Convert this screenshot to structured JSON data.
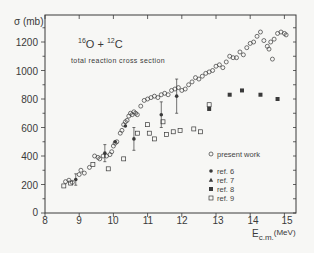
{
  "chart_data": {
    "type": "scatter",
    "title": "16O + 12C",
    "title_parts": {
      "a_mass": "16",
      "a_el": "O",
      "plus": "+",
      "b_mass": "12",
      "b_el": "C"
    },
    "subtitle": "total reaction cross section",
    "xlabel": "E",
    "xlabel_sub": "c.m.",
    "xlabel_unit": "(MeV)",
    "ylabel": "σ (mb)",
    "xlim": [
      8,
      15.3
    ],
    "ylim": [
      0,
      1390
    ],
    "xticks": [
      8,
      9,
      10,
      11,
      12,
      13,
      14,
      15
    ],
    "yticks": [
      0,
      200,
      400,
      600,
      800,
      1000,
      1200
    ],
    "xtick_labels": [
      "8",
      "9",
      "10",
      "11",
      "12",
      "13",
      "14",
      "15"
    ],
    "ytick_labels": [
      "0",
      "200",
      "400",
      "600",
      "800",
      "1000",
      "1200"
    ],
    "grid": false,
    "legend_position": "lower right inside",
    "series": [
      {
        "name": "present work",
        "marker": "open-circle",
        "points": [
          [
            8.6,
            220
          ],
          [
            8.7,
            230
          ],
          [
            8.8,
            215
          ],
          [
            9.0,
            270
          ],
          [
            9.05,
            300
          ],
          [
            9.15,
            280
          ],
          [
            9.3,
            320
          ],
          [
            9.45,
            400
          ],
          [
            9.55,
            390
          ],
          [
            9.6,
            380
          ],
          [
            9.7,
            400
          ],
          [
            9.8,
            400
          ],
          [
            9.9,
            410
          ],
          [
            9.95,
            430
          ],
          [
            10.0,
            470
          ],
          [
            10.05,
            490
          ],
          [
            10.1,
            500
          ],
          [
            10.2,
            560
          ],
          [
            10.25,
            580
          ],
          [
            10.3,
            620
          ],
          [
            10.35,
            640
          ],
          [
            10.4,
            650
          ],
          [
            10.45,
            680
          ],
          [
            10.5,
            700
          ],
          [
            10.55,
            690
          ],
          [
            10.6,
            710
          ],
          [
            10.65,
            700
          ],
          [
            10.7,
            690
          ],
          [
            10.8,
            750
          ],
          [
            10.9,
            790
          ],
          [
            11.0,
            800
          ],
          [
            11.1,
            810
          ],
          [
            11.2,
            820
          ],
          [
            11.3,
            810
          ],
          [
            11.4,
            830
          ],
          [
            11.5,
            840
          ],
          [
            11.6,
            830
          ],
          [
            11.7,
            860
          ],
          [
            11.8,
            870
          ],
          [
            11.9,
            880
          ],
          [
            12.0,
            860
          ],
          [
            12.1,
            870
          ],
          [
            12.2,
            900
          ],
          [
            12.3,
            920
          ],
          [
            12.4,
            950
          ],
          [
            12.5,
            940
          ],
          [
            12.6,
            960
          ],
          [
            12.7,
            980
          ],
          [
            12.8,
            990
          ],
          [
            12.9,
            1000
          ],
          [
            13.0,
            1030
          ],
          [
            13.1,
            1040
          ],
          [
            13.2,
            1020
          ],
          [
            13.3,
            1060
          ],
          [
            13.4,
            1100
          ],
          [
            13.5,
            1090
          ],
          [
            13.6,
            1090
          ],
          [
            13.7,
            1130
          ],
          [
            13.8,
            1110
          ],
          [
            13.9,
            1160
          ],
          [
            14.0,
            1190
          ],
          [
            14.1,
            1200
          ],
          [
            14.2,
            1240
          ],
          [
            14.3,
            1270
          ],
          [
            14.4,
            1210
          ],
          [
            14.5,
            1170
          ],
          [
            14.55,
            1150
          ],
          [
            14.6,
            1200
          ],
          [
            14.65,
            1080
          ],
          [
            14.7,
            1220
          ],
          [
            14.8,
            1260
          ],
          [
            14.9,
            1270
          ],
          [
            15.0,
            1260
          ],
          [
            15.05,
            1250
          ]
        ]
      },
      {
        "name": "ref. 6",
        "marker": "filled-circle",
        "points": [
          [
            8.9,
            235,
            40
          ],
          [
            9.75,
            420,
            60
          ],
          [
            10.05,
            500,
            15
          ],
          [
            10.35,
            610,
            15
          ],
          [
            10.6,
            520,
            80
          ],
          [
            11.4,
            690,
            90
          ],
          [
            11.85,
            820,
            120
          ]
        ]
      },
      {
        "name": "ref. 7",
        "marker": "filled-triangle",
        "points": []
      },
      {
        "name": "ref. 8",
        "marker": "filled-square",
        "points": [
          [
            12.8,
            730
          ],
          [
            13.4,
            830
          ],
          [
            13.76,
            860
          ],
          [
            14.3,
            830
          ],
          [
            14.8,
            800
          ]
        ]
      },
      {
        "name": "ref. 9",
        "marker": "open-square",
        "points": [
          [
            8.55,
            190
          ],
          [
            8.75,
            210
          ],
          [
            9.4,
            340
          ],
          [
            9.85,
            310
          ],
          [
            10.3,
            380
          ],
          [
            10.7,
            560
          ],
          [
            11.0,
            620
          ],
          [
            11.05,
            560
          ],
          [
            11.2,
            520
          ],
          [
            11.45,
            640
          ],
          [
            11.55,
            550
          ],
          [
            11.75,
            570
          ],
          [
            11.95,
            580
          ],
          [
            12.35,
            590
          ],
          [
            12.55,
            570
          ],
          [
            12.8,
            760
          ]
        ]
      }
    ]
  },
  "legend": {
    "present_work": "present work",
    "ref6": "ref.  6",
    "ref7": "ref.  7",
    "ref8": "ref.  8",
    "ref9": "ref.  9"
  },
  "colors": {
    "ink": "#3a3a3a",
    "background": "#f7f7f5"
  }
}
